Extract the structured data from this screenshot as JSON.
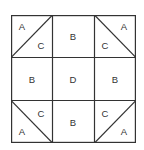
{
  "diagram": {
    "rows": [
      [
        {
          "type": "split",
          "diagonal": "up",
          "top": "A",
          "bottom": "C"
        },
        {
          "type": "solid",
          "label": "B"
        },
        {
          "type": "split",
          "diagonal": "down",
          "top": "A",
          "bottom": "C"
        }
      ],
      [
        {
          "type": "solid",
          "label": "B"
        },
        {
          "type": "solid",
          "label": "D"
        },
        {
          "type": "solid",
          "label": "B"
        }
      ],
      [
        {
          "type": "split",
          "diagonal": "down",
          "top": "C",
          "bottom": "A"
        },
        {
          "type": "solid",
          "label": "B"
        },
        {
          "type": "split",
          "diagonal": "up",
          "top": "C",
          "bottom": "A"
        }
      ]
    ],
    "labels": {
      "r0c0_a": "A",
      "r0c0_c": "C",
      "r0c1": "B",
      "r0c2_c": "C",
      "r0c2_a": "A",
      "r1c0": "B",
      "r1c1": "D",
      "r1c2": "B",
      "r2c0_c": "C",
      "r2c0_a": "A",
      "r2c1": "B",
      "r2c2_c": "C",
      "r2c2_a": "A"
    },
    "line_color": "#333333"
  }
}
